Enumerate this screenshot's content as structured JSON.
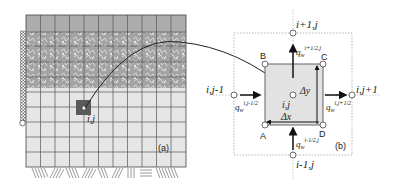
{
  "panel_a": {
    "label": "(a)",
    "cell_label": "i,j",
    "grid": {
      "columns": 11,
      "rows": 10
    },
    "colors": {
      "top_band": "#a9a9a9",
      "vegetation_band": "#9a9a9a",
      "soil": "#e6e6e6",
      "grid_line": "#555555",
      "highlight_cell": "#5a5a5a"
    }
  },
  "panel_b": {
    "label": "(b)",
    "nodes": {
      "center": "i,j",
      "top": "i+1,j",
      "bottom": "i-1,j",
      "left": "i,j-1",
      "right": "i,j+1"
    },
    "corners": {
      "A": "A",
      "B": "B",
      "C": "C",
      "D": "D"
    },
    "fluxes": {
      "top": {
        "base": "q",
        "sub": "w",
        "sup": "i+1/2,j"
      },
      "bottom": {
        "base": "q",
        "sub": "w",
        "sup": "i-1/2,j"
      },
      "left": {
        "base": "q",
        "sub": "w",
        "sup": "i,j-1/2"
      },
      "right": {
        "base": "q",
        "sub": "w",
        "sup": "i,j+1/2"
      }
    },
    "dx_label": "Δx",
    "dy_label": "Δy",
    "colors": {
      "cell_fill": "#e2e2e2",
      "line": "#333333"
    }
  }
}
